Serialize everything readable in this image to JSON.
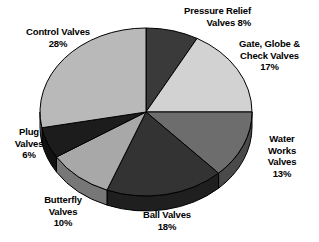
{
  "chart_data": {
    "type": "pie",
    "title": "",
    "subtitle": "",
    "xlabel": "",
    "ylabel": "",
    "legend_position": "none",
    "grid": false,
    "units": "percent",
    "total": 100,
    "three_d": true,
    "start_angle_deg": 0,
    "direction": "clockwise",
    "categories": [
      "Pressure Relief Valves",
      "Gate, Globe & Check Valves",
      "Water Works Valves",
      "Ball Valves",
      "Butterfly Valves",
      "Plug Valves",
      "Control Valves"
    ],
    "values": [
      8,
      17,
      13,
      18,
      10,
      6,
      28
    ],
    "slices": [
      {
        "name": "pressure-relief",
        "label_lines": [
          "Pressure Relief",
          "Valves  8%"
        ],
        "name_text": "Pressure Relief Valves",
        "value": 8,
        "value_text": "8%",
        "color": "#3a3a3a",
        "side_color": "#252525"
      },
      {
        "name": "gate-globe-check",
        "label_lines": [
          "Gate, Globe &",
          "Check Valves",
          "17%"
        ],
        "name_text": "Gate, Globe & Check Valves",
        "value": 17,
        "value_text": "17%",
        "color": "#d2d2d2",
        "side_color": "#9a9a9a"
      },
      {
        "name": "water-works",
        "label_lines": [
          "Water",
          "Works",
          "Valves",
          "13%"
        ],
        "name_text": "Water Works Valves",
        "value": 13,
        "value_text": "13%",
        "color": "#6d6d6d",
        "side_color": "#4a4a4a"
      },
      {
        "name": "ball",
        "label_lines": [
          "Ball Valves",
          "18%"
        ],
        "name_text": "Ball Valves",
        "value": 18,
        "value_text": "18%",
        "color": "#333333",
        "side_color": "#1f1f1f"
      },
      {
        "name": "butterfly",
        "label_lines": [
          "Butterfly",
          "Valves",
          "10%"
        ],
        "name_text": "Butterfly Valves",
        "value": 10,
        "value_text": "10%",
        "color": "#a8a8a8",
        "side_color": "#777777"
      },
      {
        "name": "plug",
        "label_lines": [
          "Plug",
          "Valves",
          "6%"
        ],
        "name_text": "Plug Valves",
        "value": 6,
        "value_text": "6%",
        "color": "#1c1c1c",
        "side_color": "#121212"
      },
      {
        "name": "control",
        "label_lines": [
          "Control Valves",
          "28%"
        ],
        "name_text": "Control Valves",
        "value": 28,
        "value_text": "28%",
        "color": "#b9b9b9",
        "side_color": "#8b8b8b"
      }
    ],
    "colors": {
      "background": "#ffffff",
      "text": "#000000",
      "outline": "#000000"
    }
  },
  "labels": {
    "pressure_relief": {
      "line1": "Pressure Relief",
      "line2": "Valves  8%"
    },
    "gate_globe": {
      "line1": "Gate, Globe &",
      "line2": "Check Valves",
      "line3": "17%"
    },
    "water_works": {
      "line1": "Water",
      "line2": "Works",
      "line3": "Valves",
      "line4": "13%"
    },
    "ball": {
      "line1": "Ball Valves",
      "line2": "18%"
    },
    "butterfly": {
      "line1": "Butterfly",
      "line2": "Valves",
      "line3": "10%"
    },
    "plug": {
      "line1": "Plug",
      "line2": "Valves",
      "line3": "6%"
    },
    "control": {
      "line1": "Control Valves",
      "line2": "28%"
    }
  }
}
